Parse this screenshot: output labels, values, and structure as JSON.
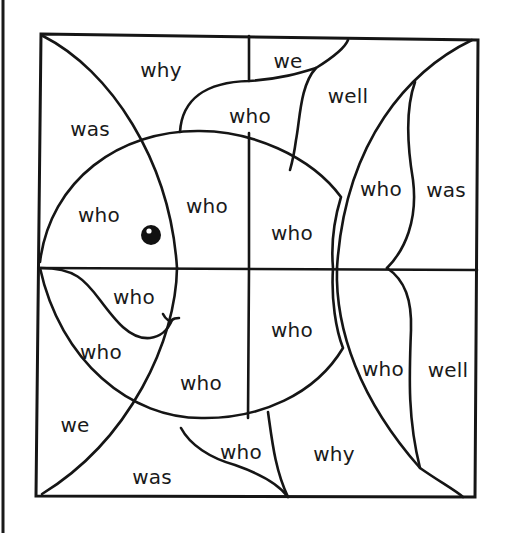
{
  "worksheet": {
    "subject": "color-by-word fish puzzle",
    "ink_color": "#151515",
    "background": "#ffffff"
  },
  "regions": [
    {
      "id": "top-left-why",
      "word": "why",
      "x": 161,
      "y": 70
    },
    {
      "id": "top-fin-we",
      "word": "we",
      "x": 288,
      "y": 61
    },
    {
      "id": "top-fin-who",
      "word": "who",
      "x": 250,
      "y": 116
    },
    {
      "id": "top-right-well",
      "word": "well",
      "x": 348,
      "y": 96
    },
    {
      "id": "left-was",
      "word": "was",
      "x": 90,
      "y": 129
    },
    {
      "id": "head-who",
      "word": "who",
      "x": 99,
      "y": 215
    },
    {
      "id": "body-upper-left-who",
      "word": "who",
      "x": 207,
      "y": 206
    },
    {
      "id": "body-upper-right-who",
      "word": "who",
      "x": 292,
      "y": 233
    },
    {
      "id": "tail-upper-who",
      "word": "who",
      "x": 381,
      "y": 189
    },
    {
      "id": "right-upper-was",
      "word": "was",
      "x": 446,
      "y": 190
    },
    {
      "id": "mouth-who",
      "word": "who",
      "x": 134,
      "y": 297
    },
    {
      "id": "chin-who",
      "word": "who",
      "x": 101,
      "y": 352
    },
    {
      "id": "body-lower-right-who",
      "word": "who",
      "x": 292,
      "y": 330
    },
    {
      "id": "body-lower-left-who",
      "word": "who",
      "x": 201,
      "y": 383
    },
    {
      "id": "tail-lower-who",
      "word": "who",
      "x": 383,
      "y": 369
    },
    {
      "id": "right-lower-well",
      "word": "well",
      "x": 448,
      "y": 370
    },
    {
      "id": "bottom-left-we",
      "word": "we",
      "x": 75,
      "y": 425
    },
    {
      "id": "bottom-fin-who",
      "word": "who",
      "x": 241,
      "y": 452
    },
    {
      "id": "bottom-right-why",
      "word": "why",
      "x": 334,
      "y": 454
    },
    {
      "id": "bottom-was",
      "word": "was",
      "x": 152,
      "y": 477
    }
  ]
}
